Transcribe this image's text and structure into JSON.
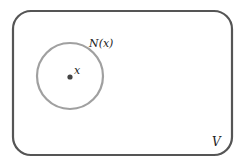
{
  "diagram": {
    "set_label": "V",
    "neighborhood_label": "N(x)",
    "point_label": "x",
    "colors": {
      "set_border": "#555555",
      "neighborhood_border": "#a0a0a0",
      "point": "#444444",
      "text": "#222222"
    }
  }
}
